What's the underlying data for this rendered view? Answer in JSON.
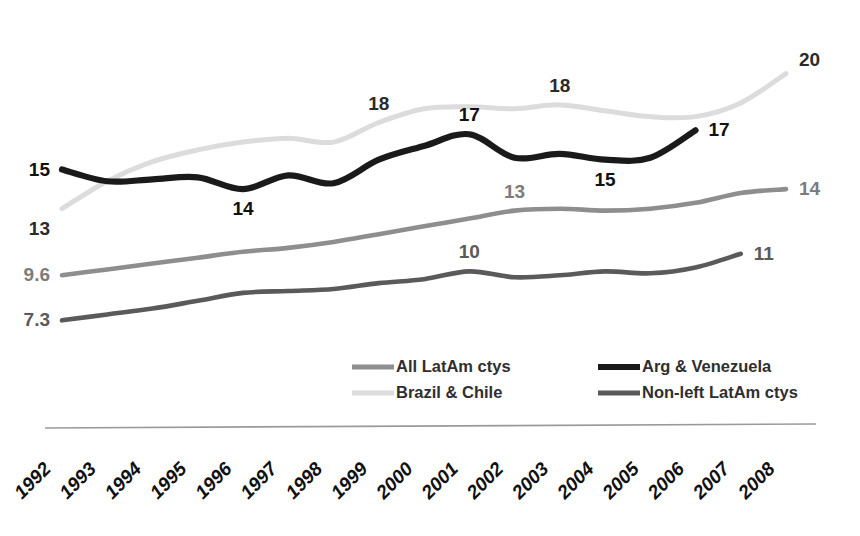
{
  "chart_data": {
    "type": "line",
    "title": "",
    "subtitle": "",
    "xlabel": "",
    "ylabel": "",
    "grid": false,
    "legend_position": "bottom-center",
    "x": [
      1992,
      1993,
      1994,
      1995,
      1996,
      1997,
      1998,
      1999,
      2000,
      2001,
      2002,
      2003,
      2004,
      2005,
      2006,
      2007,
      2008
    ],
    "xlim": [
      1992,
      2008
    ],
    "ylim": [
      6.5,
      21.0
    ],
    "series": [
      {
        "name": "All LatAm ctys",
        "color": "#8e8e8e",
        "start_label": "9.6",
        "end_label": "14",
        "mid_labels": [
          {
            "x": 2002,
            "text": "13"
          }
        ],
        "values": [
          9.6,
          9.9,
          10.2,
          10.5,
          10.8,
          11.0,
          11.3,
          11.7,
          12.1,
          12.5,
          12.9,
          13.0,
          12.9,
          13.0,
          13.3,
          13.8,
          14.0
        ]
      },
      {
        "name": "Brazil & Chile",
        "color": "#dcdcdc",
        "start_label": "13",
        "end_label": "20",
        "mid_labels": [
          {
            "x": 1999,
            "text": "18"
          },
          {
            "x": 2003,
            "text": "18"
          }
        ],
        "values": [
          13.0,
          14.4,
          15.4,
          16.0,
          16.4,
          16.6,
          16.4,
          17.4,
          18.1,
          18.2,
          18.1,
          18.3,
          18.0,
          17.7,
          17.7,
          18.4,
          19.9
        ]
      },
      {
        "name": "Arg & Venezuela",
        "color": "#1a1a1a",
        "start_label": "15",
        "end_label": "17",
        "mid_labels": [
          {
            "x": 1996,
            "text": "14"
          },
          {
            "x": 2001,
            "text": "17"
          },
          {
            "x": 2004,
            "text": "15"
          }
        ],
        "values": [
          15.0,
          14.4,
          14.5,
          14.6,
          14.0,
          14.7,
          14.3,
          15.5,
          16.2,
          16.8,
          15.6,
          15.8,
          15.5,
          15.6,
          17.0,
          null,
          null
        ]
      },
      {
        "name": "Non-left LatAm ctys",
        "color": "#5a5a5a",
        "start_label": "7.3",
        "end_label": "11",
        "mid_labels": [
          {
            "x": 2001,
            "text": "10"
          }
        ],
        "values": [
          7.3,
          7.6,
          7.9,
          8.3,
          8.7,
          8.8,
          8.9,
          9.2,
          9.4,
          9.8,
          9.5,
          9.6,
          9.8,
          9.7,
          10.0,
          10.7,
          null
        ]
      }
    ],
    "xtick_labels": [
      "1992",
      "1993",
      "1994",
      "1995",
      "1996",
      "1997",
      "1998",
      "1999",
      "2000",
      "2001",
      "2002",
      "2003",
      "2004",
      "2005",
      "2006",
      "2007",
      "2008"
    ]
  },
  "legend": {
    "entries": [
      {
        "label": "All LatAm ctys",
        "color": "#8e8e8e"
      },
      {
        "label": "Brazil & Chile",
        "color": "#dcdcdc"
      },
      {
        "label": "Arg & Venezuela",
        "color": "#1a1a1a"
      },
      {
        "label": "Non-left LatAm ctys",
        "color": "#5a5a5a"
      }
    ]
  },
  "colors": {
    "background": "#ffffff",
    "axis": "#9a9a9a",
    "text": "#111111"
  }
}
